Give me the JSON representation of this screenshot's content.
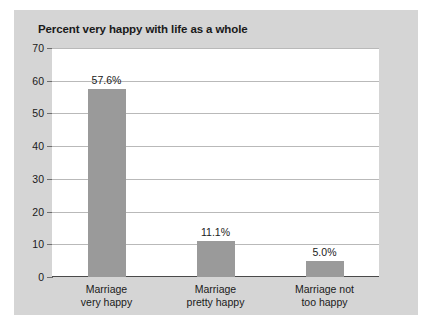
{
  "chart_data": {
    "type": "bar",
    "title": "Percent very happy with life as a whole",
    "xlabel": "",
    "ylabel": "",
    "categories": [
      "Marriage very happy",
      "Marriage pretty happy",
      "Marriage not too happy"
    ],
    "category_lines": [
      [
        "Marriage",
        "very happy"
      ],
      [
        "Marriage",
        "pretty happy"
      ],
      [
        "Marriage not",
        "too happy"
      ]
    ],
    "values": [
      57.6,
      11.1,
      5.0
    ],
    "data_labels": [
      "57.6%",
      "11.1%",
      "5.0%"
    ],
    "ylim": [
      0,
      70
    ],
    "ytick_labels": [
      "70",
      "60",
      "50",
      "40",
      "30",
      "20",
      "10",
      "0"
    ],
    "ytick_values": [
      70,
      60,
      50,
      40,
      30,
      20,
      10,
      0
    ],
    "ytick_step": 10,
    "grid": true,
    "legend": false,
    "legend_position": "none",
    "colors": {
      "bar": "#9a9a9a",
      "panel_background": "#d5d5d5",
      "plot_background": "#ffffff",
      "gridline": "#b9b9b9",
      "axis": "#6e6e6e",
      "text": "#1a1a1a"
    }
  }
}
